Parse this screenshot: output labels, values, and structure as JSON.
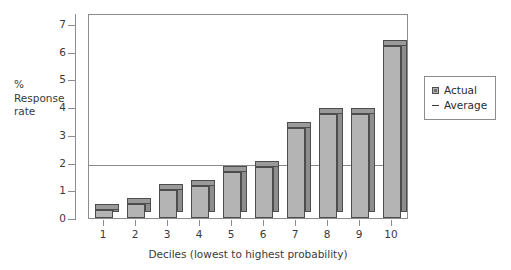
{
  "chart_data": {
    "type": "bar",
    "title": "",
    "xlabel": "Deciles (lowest to highest probability)",
    "ylabel": "% Response rate",
    "ylabel_lines": [
      "%",
      "Response",
      "rate"
    ],
    "categories": [
      "1",
      "2",
      "3",
      "4",
      "5",
      "6",
      "7",
      "8",
      "9",
      "10"
    ],
    "values": [
      0.3,
      0.5,
      1.0,
      1.15,
      1.65,
      1.85,
      3.25,
      3.75,
      3.75,
      6.2
    ],
    "series": [
      {
        "name": "Actual",
        "values": [
          0.3,
          0.5,
          1.0,
          1.15,
          1.65,
          1.85,
          3.25,
          3.75,
          3.75,
          6.2
        ]
      }
    ],
    "reference_lines": [
      {
        "name": "Average",
        "value": 2.0,
        "orientation": "horizontal"
      }
    ],
    "ylim": [
      0,
      7.4
    ],
    "yticks": [
      0,
      1,
      2,
      3,
      4,
      5,
      6,
      7
    ],
    "ytick_labels": [
      "0",
      "1",
      "2",
      "3",
      "4",
      "5",
      "6",
      "7"
    ],
    "grid": false,
    "legend_position": "right",
    "legend": [
      {
        "label": "Actual",
        "marker": "square-swatch-icon",
        "color": "#b4b4b4"
      },
      {
        "label": "Average",
        "marker": "dash-line-icon",
        "color": "#3a3a3a"
      }
    ],
    "colors": {
      "bar_front": "#b4b4b4",
      "bar_side": "#8d8d8d",
      "bar_top": "#9a9a9a",
      "bar_edge": "#4d4d4d",
      "axis": "#8c8c8c",
      "text": "#2b2b2b",
      "background": "#ffffff"
    }
  }
}
